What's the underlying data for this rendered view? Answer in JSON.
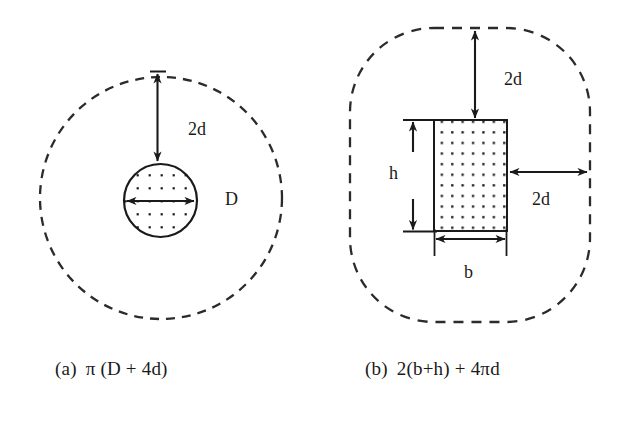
{
  "figure": {
    "background_color": "#ffffff",
    "ink_color": "#1a1a1a",
    "panels": [
      {
        "id": "panel-a",
        "shape": "circle",
        "caption_index": "(a)",
        "caption_expression": "π (D + 4d)",
        "labels": [
          {
            "name": "clearance-label-top",
            "text": "2d"
          },
          {
            "name": "diameter-label",
            "text": "D"
          }
        ],
        "outer_boundary": "dashed-circle",
        "inner_body": "dotted-circle",
        "dimensions": [
          {
            "name": "vertical-clearance",
            "text": "2d",
            "direction": "vertical",
            "double_headed": true
          },
          {
            "name": "diameter",
            "text": "D",
            "direction": "horizontal",
            "double_headed": true
          }
        ]
      },
      {
        "id": "panel-b",
        "shape": "rectangle",
        "caption_index": "(b)",
        "caption_expression": "2(b+h) + 4πd",
        "labels": [
          {
            "name": "clearance-label-top",
            "text": "2d"
          },
          {
            "name": "clearance-label-right",
            "text": "2d"
          },
          {
            "name": "height-label",
            "text": "h"
          },
          {
            "name": "width-label",
            "text": "b"
          }
        ],
        "outer_boundary": "dashed-rounded-rectangle",
        "inner_body": "dotted-rectangle",
        "dimensions": [
          {
            "name": "vertical-clearance",
            "text": "2d",
            "direction": "vertical",
            "double_headed": true
          },
          {
            "name": "horizontal-clearance",
            "text": "2d",
            "direction": "horizontal",
            "double_headed": true
          },
          {
            "name": "height",
            "text": "h",
            "direction": "vertical",
            "double_headed": true
          },
          {
            "name": "width",
            "text": "b",
            "direction": "horizontal",
            "double_headed": true
          }
        ]
      }
    ]
  },
  "labels": {
    "a_clearance_top": "2d",
    "a_diameter": "D",
    "b_clearance_top": "2d",
    "b_clearance_right": "2d",
    "b_height": "h",
    "b_width": "b"
  },
  "captions": {
    "a_index": "(a)",
    "a_expression": "π (D + 4d)",
    "b_index": "(b)",
    "b_expression": "2(b+h) + 4πd"
  }
}
